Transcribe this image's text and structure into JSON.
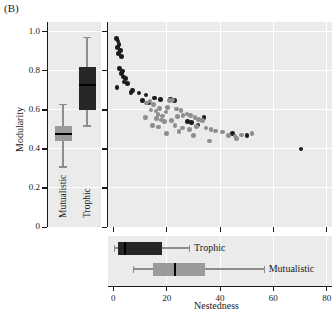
{
  "figure": {
    "panel_label": "(B)",
    "colors": {
      "panel_bg": "#ebebeb",
      "grid": "#ffffff",
      "trophic": "#1c1c1c",
      "mutualistic": "#8e8e8e",
      "axis": "#1a1a1a"
    }
  },
  "chart_data": [
    {
      "type": "box",
      "id": "modularity-box-panel",
      "title": "",
      "xlabel": "",
      "ylabel": "Modularity",
      "ylim": [
        0,
        1.05
      ],
      "yticks": [
        0,
        0.2,
        0.4,
        0.6,
        0.8,
        1.0
      ],
      "yticklabels": [
        "0",
        "0.2",
        "0.4",
        "0.6",
        "0.8",
        "1.0"
      ],
      "grid": true,
      "orientation": "vertical",
      "categories": [
        "Mutualistic",
        "Trophic"
      ],
      "boxes": [
        {
          "name": "Mutualistic",
          "color": "#9a9a9a",
          "whisker_low": 0.31,
          "q1": 0.442,
          "median": 0.478,
          "q3": 0.518,
          "whisker_high": 0.632
        },
        {
          "name": "Trophic",
          "color": "#262626",
          "whisker_low": 0.52,
          "q1": 0.601,
          "median": 0.727,
          "q3": 0.818,
          "whisker_high": 0.972
        }
      ]
    },
    {
      "type": "scatter",
      "id": "nestedness-modularity-scatter",
      "title": "",
      "xlabel": "Nestedness",
      "ylabel": "Modularity",
      "xlim": [
        -2,
        82
      ],
      "ylim": [
        0,
        1.05
      ],
      "xticks": [
        0,
        20,
        40,
        60,
        80
      ],
      "yticks": [
        0,
        0.2,
        0.4,
        0.6,
        0.8,
        1.0
      ],
      "grid": true,
      "legend_position": "none",
      "series": [
        {
          "name": "Trophic",
          "color": "#1c1c1c",
          "points": [
            [
              1.2,
              0.965
            ],
            [
              1.8,
              0.952
            ],
            [
              2.2,
              0.935
            ],
            [
              1.6,
              0.92
            ],
            [
              2.6,
              0.905
            ],
            [
              2.0,
              0.888
            ],
            [
              3.0,
              0.872
            ],
            [
              2.4,
              0.812
            ],
            [
              3.4,
              0.8
            ],
            [
              3.0,
              0.786
            ],
            [
              3.8,
              0.768
            ],
            [
              4.6,
              0.76
            ],
            [
              4.0,
              0.742
            ],
            [
              1.4,
              0.714
            ],
            [
              5.4,
              0.735
            ],
            [
              7.2,
              0.7
            ],
            [
              6.6,
              0.688
            ],
            [
              9.6,
              0.686
            ],
            [
              12.2,
              0.676
            ],
            [
              15.4,
              0.66
            ],
            [
              17.6,
              0.654
            ],
            [
              11.0,
              0.648
            ],
            [
              13.2,
              0.636
            ],
            [
              21.4,
              0.655
            ],
            [
              23.0,
              0.648
            ],
            [
              27.8,
              0.54
            ],
            [
              29.4,
              0.534
            ],
            [
              31.8,
              0.522
            ],
            [
              34.0,
              0.56
            ],
            [
              44.6,
              0.478
            ],
            [
              50.2,
              0.47
            ],
            [
              70.4,
              0.4
            ]
          ]
        },
        {
          "name": "Mutualistic",
          "color": "#8e8e8e",
          "points": [
            [
              12.4,
              0.636
            ],
            [
              13.8,
              0.646
            ],
            [
              15.0,
              0.628
            ],
            [
              14.2,
              0.6
            ],
            [
              16.0,
              0.594
            ],
            [
              17.4,
              0.606
            ],
            [
              16.8,
              0.575
            ],
            [
              18.4,
              0.568
            ],
            [
              19.8,
              0.59
            ],
            [
              21.0,
              0.648
            ],
            [
              22.2,
              0.65
            ],
            [
              20.4,
              0.612
            ],
            [
              23.6,
              0.604
            ],
            [
              25.4,
              0.598
            ],
            [
              12.0,
              0.562
            ],
            [
              16.2,
              0.556
            ],
            [
              18.0,
              0.548
            ],
            [
              19.2,
              0.54
            ],
            [
              21.8,
              0.545
            ],
            [
              24.0,
              0.566
            ],
            [
              26.2,
              0.572
            ],
            [
              27.6,
              0.578
            ],
            [
              29.0,
              0.57
            ],
            [
              30.6,
              0.56
            ],
            [
              32.0,
              0.552
            ],
            [
              33.4,
              0.545
            ],
            [
              17.0,
              0.512
            ],
            [
              23.2,
              0.52
            ],
            [
              26.0,
              0.508
            ],
            [
              28.6,
              0.5
            ],
            [
              31.2,
              0.516
            ],
            [
              34.8,
              0.508
            ],
            [
              36.6,
              0.5
            ],
            [
              38.4,
              0.492
            ],
            [
              41.0,
              0.486
            ],
            [
              43.2,
              0.47
            ],
            [
              45.6,
              0.466
            ],
            [
              48.0,
              0.472
            ],
            [
              52.0,
              0.48
            ],
            [
              36.0,
              0.44
            ],
            [
              46.2,
              0.452
            ],
            [
              24.6,
              0.49
            ],
            [
              20.0,
              0.478
            ],
            [
              14.6,
              0.52
            ],
            [
              30.0,
              0.468
            ]
          ]
        }
      ]
    },
    {
      "type": "box",
      "id": "nestedness-box-panel",
      "title": "",
      "xlabel": "Nestedness",
      "ylabel": "",
      "xlim": [
        -2,
        82
      ],
      "xticks": [
        0,
        20,
        40,
        60,
        80
      ],
      "xticklabels": [
        "0",
        "20",
        "40",
        "60",
        "80"
      ],
      "grid": true,
      "orientation": "horizontal",
      "boxes": [
        {
          "name": "Trophic",
          "label": "Trophic",
          "color": "#262626",
          "whisker_low": 0.2,
          "q1": 1.8,
          "median": 4.2,
          "q3": 18.2,
          "whisker_high": 28.4
        },
        {
          "name": "Mutualistic",
          "label": "Mutualistic",
          "color": "#9a9a9a",
          "whisker_low": 7.2,
          "q1": 15.0,
          "median": 23.0,
          "q3": 34.2,
          "whisker_high": 56.4
        }
      ]
    }
  ]
}
